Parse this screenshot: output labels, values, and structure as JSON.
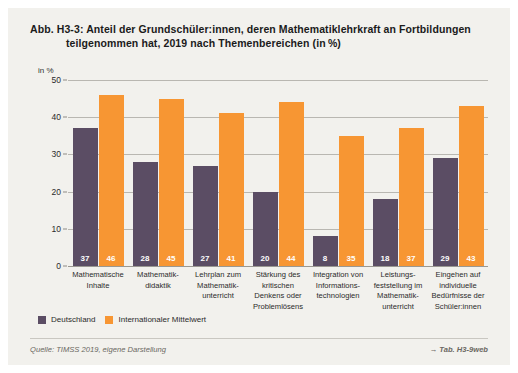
{
  "figure": {
    "label": "Abb. H3-3:",
    "title_line1": "Abb. H3-3:  Anteil der Grundschüler:innen, deren Mathematiklehrkraft an Fortbildungen",
    "title_line2": "teilgenommen hat, 2019 nach Themenbereichen (in %)",
    "source": "Quelle: TIMSS 2019, eigene Darstellung",
    "table_ref": "→ Tab. H3-9web"
  },
  "legend": {
    "items": [
      {
        "label": "Deutschland",
        "color": "#5b4d64"
      },
      {
        "label": "Internationaler Mittelwert",
        "color": "#f79633"
      }
    ]
  },
  "chart_data": {
    "type": "bar",
    "xlabel": "",
    "ylabel": "in %",
    "unit_label": "in %",
    "ylim": [
      0,
      50
    ],
    "yticks": [
      0,
      10,
      20,
      30,
      40,
      50
    ],
    "ytick_labels": [
      "0",
      "10",
      "20",
      "30",
      "40",
      "50"
    ],
    "grid": true,
    "legend_position": "bottom-left",
    "categories": [
      "Mathematische Inhalte",
      "Mathematik-didaktik",
      "Lehrplan zum Mathematik-unterricht",
      "Stärkung des kritischen Denkens oder Problemlösens",
      "Integration von Informations-technologien",
      "Leistungs-feststellung im Mathematik-unterricht",
      "Eingehen auf individuelle Bedürfnisse der Schüler:innen"
    ],
    "category_lines": [
      [
        "Mathematische",
        "Inhalte"
      ],
      [
        "Mathematik-",
        "didaktik"
      ],
      [
        "Lehrplan zum",
        "Mathematik-",
        "unterricht"
      ],
      [
        "Stärkung des",
        "kritischen",
        "Denkens oder",
        "Problemlösens"
      ],
      [
        "Integration von",
        "Informations-",
        "technologien"
      ],
      [
        "Leistungs-",
        "feststellung im",
        "Mathematik-",
        "unterricht"
      ],
      [
        "Eingehen auf",
        "individuelle",
        "Bedürfnisse der",
        "Schüler:innen"
      ]
    ],
    "series": [
      {
        "name": "Deutschland",
        "color": "#5b4d64",
        "values": [
          37,
          28,
          27,
          20,
          8,
          18,
          29
        ]
      },
      {
        "name": "Internationaler Mittelwert",
        "color": "#f79633",
        "values": [
          46,
          45,
          41,
          44,
          35,
          37,
          43
        ]
      }
    ]
  },
  "colors": {
    "panel_background": "#f2f1ed",
    "deutschland": "#5b4d64",
    "international": "#f79633",
    "gridline": "#b9b7b1",
    "text": "#2b2b2b"
  }
}
